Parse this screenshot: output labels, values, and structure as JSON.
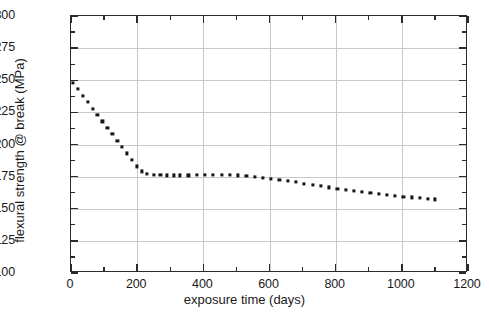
{
  "chart_data": {
    "type": "scatter",
    "title": "",
    "subtitle": "",
    "xlabel": "exposure time (days)",
    "ylabel": "flexural strength @ break (MPa)",
    "xlim": [
      0,
      1200
    ],
    "ylim": [
      100,
      300
    ],
    "xticks": [
      0,
      200,
      400,
      600,
      800,
      1000,
      1200
    ],
    "yticks": [
      100,
      125,
      150,
      175,
      200,
      225,
      250,
      275,
      300
    ],
    "xtick_labels": [
      "0",
      "200",
      "400",
      "600",
      "800",
      "1000",
      "1200"
    ],
    "ytick_labels": [
      "100",
      "125",
      "150",
      "175",
      "200",
      "225",
      "250",
      "275",
      "300"
    ],
    "x_minor_interval": 100,
    "y_minor_interval": 12.5,
    "grid": true,
    "grid_color": "#c9c9c9",
    "legend": false,
    "legend_position": "none",
    "marker": "square",
    "marker_color": "#151515",
    "marker_size_px": 3,
    "line_style": "none",
    "frame_color": "#2b2b2b",
    "background_color": "#ffffff",
    "series": [
      {
        "name": "flexural strength @ break",
        "x": [
          5,
          20,
          35,
          50,
          65,
          80,
          95,
          110,
          125,
          140,
          155,
          170,
          185,
          200,
          215,
          230,
          250,
          270,
          290,
          310,
          330,
          355,
          380,
          405,
          430,
          455,
          480,
          505,
          530,
          555,
          580,
          605,
          630,
          655,
          680,
          705,
          730,
          755,
          780,
          805,
          830,
          855,
          880,
          905,
          930,
          955,
          980,
          1005,
          1030,
          1055,
          1080,
          1100
        ],
        "y": [
          248,
          243,
          238,
          233,
          228,
          223,
          218,
          213,
          208,
          203,
          198,
          193,
          188,
          183,
          179,
          177,
          176.5,
          176.2,
          176,
          176,
          176,
          176,
          176.2,
          176.3,
          176.4,
          176.5,
          176.3,
          176,
          175.5,
          175,
          174.2,
          173.4,
          172.5,
          171.6,
          170.6,
          169.6,
          168.6,
          167.6,
          166.6,
          165.7,
          164.8,
          164,
          163.2,
          162.4,
          161.6,
          160.9,
          160.2,
          159.5,
          158.8,
          158.2,
          157.6,
          157.2
        ]
      }
    ]
  },
  "axes": {
    "x_title": "exposure time (days)",
    "y_title": "flexural strength @ break (MPa)"
  }
}
